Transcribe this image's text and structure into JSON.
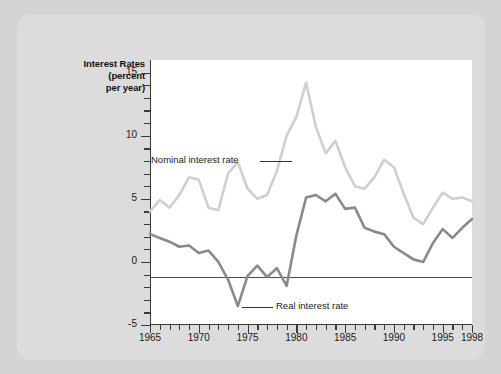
{
  "figure": {
    "background_color": "#d4d4d4",
    "card_color": "#dcdcdc",
    "plot_background": "#ffffff",
    "axis_color": "#3a3a3a"
  },
  "chart_data": {
    "type": "line",
    "title": "Interest Rates\n(percent\nper year)",
    "title_lines": [
      "Interest Rates",
      "(percent",
      "per year)"
    ],
    "xlabel": "",
    "ylabel": "Interest Rates (percent per year)",
    "xlim": [
      1965,
      1998
    ],
    "ylim": [
      -5,
      16
    ],
    "grid": false,
    "legend_position": "inline-annotations",
    "y_major_ticks": [
      -5,
      0,
      5,
      10,
      15
    ],
    "y_tick_labels": [
      "-5",
      "0",
      "5",
      "10",
      "15"
    ],
    "y_minor_tick_step": 1,
    "x_major_ticks": [
      1965,
      1970,
      1975,
      1980,
      1985,
      1990,
      1995,
      1998
    ],
    "x_tick_labels": [
      "1965",
      "1970",
      "1975",
      "1980",
      "1985",
      "1990",
      "1995",
      "1998"
    ],
    "x_minor_tick_step": 1,
    "zero_reference_line": 0,
    "x": [
      1965,
      1966,
      1967,
      1968,
      1969,
      1970,
      1971,
      1972,
      1973,
      1974,
      1975,
      1976,
      1977,
      1978,
      1979,
      1980,
      1981,
      1982,
      1983,
      1984,
      1985,
      1986,
      1987,
      1988,
      1989,
      1990,
      1991,
      1992,
      1993,
      1994,
      1995,
      1996,
      1997,
      1998
    ],
    "series": [
      {
        "name": "Nominal interest rate",
        "color": "#cfcfcf",
        "annotation": "Nominal interest rate",
        "values": [
          4.0,
          4.9,
          4.3,
          5.3,
          6.7,
          6.5,
          4.3,
          4.1,
          7.0,
          7.9,
          5.8,
          5.0,
          5.3,
          7.2,
          10.0,
          11.5,
          14.2,
          10.7,
          8.6,
          9.6,
          7.5,
          6.0,
          5.8,
          6.7,
          8.1,
          7.5,
          5.4,
          3.5,
          3.0,
          4.3,
          5.5,
          5.0,
          5.1,
          4.8
        ]
      },
      {
        "name": "Real interest rate",
        "color": "#8a8a8a",
        "annotation": "Real interest rate",
        "values": [
          2.2,
          1.9,
          1.6,
          1.2,
          1.3,
          0.7,
          0.9,
          0.0,
          -1.4,
          -3.5,
          -1.1,
          -0.3,
          -1.2,
          -0.5,
          -1.9,
          2.1,
          5.1,
          5.3,
          4.8,
          5.4,
          4.2,
          4.3,
          2.7,
          2.4,
          2.2,
          1.2,
          0.7,
          0.2,
          0.0,
          1.5,
          2.6,
          1.9,
          2.7,
          3.4
        ]
      }
    ],
    "annotations": [
      {
        "text": "Nominal interest rate",
        "x": 1966.5,
        "y": 9.5
      },
      {
        "text": "Real interest rate",
        "x": 1979.5,
        "y": -3.9
      }
    ]
  }
}
